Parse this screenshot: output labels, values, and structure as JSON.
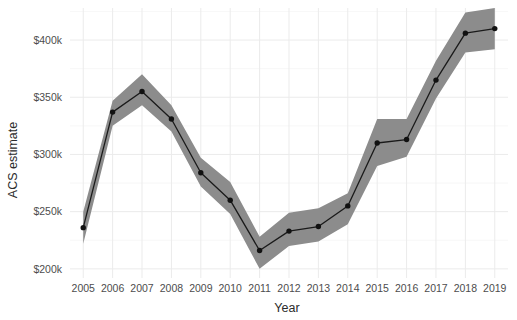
{
  "chart_data": {
    "type": "line",
    "title": "",
    "xlabel": "Year",
    "ylabel": "ACS estimate",
    "x": [
      2005,
      2006,
      2007,
      2008,
      2009,
      2010,
      2011,
      2012,
      2013,
      2014,
      2015,
      2016,
      2017,
      2018,
      2019
    ],
    "xtick_labels": [
      "2005",
      "2006",
      "2007",
      "2008",
      "2009",
      "2010",
      "2011",
      "2012",
      "2013",
      "2014",
      "2015",
      "2016",
      "2017",
      "2018",
      "2019"
    ],
    "ytick_values": [
      200000,
      250000,
      300000,
      350000,
      400000
    ],
    "ytick_labels": [
      "$200k",
      "$250k",
      "$300k",
      "$350k",
      "$400k"
    ],
    "xlim": [
      2004.55,
      2019.45
    ],
    "ylim": [
      192000,
      428000
    ],
    "grid": true,
    "legend": "none",
    "series": [
      {
        "name": "ACS estimate",
        "values": [
          236000,
          337000,
          355000,
          331000,
          284000,
          260000,
          216000,
          233000,
          237000,
          255000,
          310000,
          313000,
          365000,
          406000,
          410000
        ],
        "ribbon_lower": [
          222000,
          325000,
          343000,
          320000,
          272000,
          248000,
          200000,
          220000,
          224000,
          239000,
          290000,
          298000,
          349000,
          389000,
          392000
        ],
        "ribbon_upper": [
          250000,
          347000,
          370000,
          343000,
          297000,
          276000,
          228000,
          249000,
          253000,
          266000,
          331000,
          331000,
          382000,
          424000,
          428000
        ],
        "line_color": "#1a1a1a",
        "point_color": "#111111",
        "ribbon_color": "#8c8c8c"
      }
    ]
  },
  "style": {
    "background": "#ffffff",
    "grid_major_color": "#ebebeb",
    "grid_minor_color": "#f4f4f4",
    "axis_text_color": "#4d4d4d",
    "axis_title_color": "#2b2b2b"
  }
}
